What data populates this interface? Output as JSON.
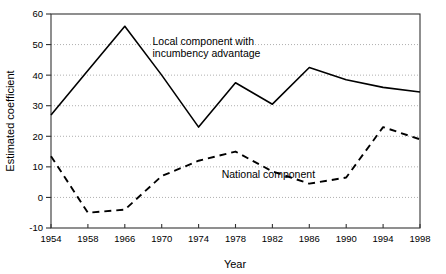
{
  "chart_data": {
    "type": "line",
    "title": "",
    "xlabel": "Year",
    "ylabel": "Estimated coefficient",
    "xlim": [
      1954,
      1998
    ],
    "ylim": [
      -10,
      60
    ],
    "xticks": [
      1954,
      1958,
      1966,
      1970,
      1974,
      1978,
      1982,
      1986,
      1990,
      1994,
      1998
    ],
    "xtick_labels": [
      "1954",
      "1958",
      "1966",
      "1970",
      "1974",
      "1978",
      "1982",
      "1986",
      "1990",
      "1994",
      "1998"
    ],
    "yticks": [
      -10,
      0,
      10,
      20,
      30,
      40,
      50,
      60
    ],
    "ytick_labels": [
      "-10",
      "0",
      "10",
      "20",
      "30",
      "40",
      "50",
      "60"
    ],
    "grid": true,
    "grid_style": "dotted-horizontal",
    "legend_position": "inline-annotation",
    "series": [
      {
        "name": "Local component with incumbency advantage",
        "style": "solid",
        "color": "#000000",
        "x": [
          1954,
          1958,
          1966,
          1970,
          1974,
          1978,
          1982,
          1986,
          1990,
          1994,
          1998
        ],
        "values": [
          27.0,
          41.5,
          56.0,
          40.0,
          23.0,
          37.5,
          30.5,
          42.5,
          38.5,
          36.0,
          34.5
        ]
      },
      {
        "name": "National component",
        "style": "dashed",
        "color": "#000000",
        "x": [
          1954,
          1958,
          1966,
          1970,
          1974,
          1978,
          1982,
          1986,
          1990,
          1994,
          1998
        ],
        "values": [
          13.5,
          -5.0,
          -4.0,
          7.0,
          12.0,
          15.0,
          8.5,
          4.5,
          6.5,
          23.0,
          19.0
        ]
      }
    ],
    "annotations": [
      {
        "id": "local-annotation-line1",
        "text": "Local component with",
        "x": 1969.0,
        "y": 50.0
      },
      {
        "id": "local-annotation-line2",
        "text": "incumbency advantage",
        "x": 1969.0,
        "y": 46.0
      },
      {
        "id": "national-annotation",
        "text": "National component",
        "x": 1976.5,
        "y": 6.5
      }
    ]
  },
  "axes": {
    "x_title": "Year",
    "y_title": "Estimated coefficient"
  }
}
